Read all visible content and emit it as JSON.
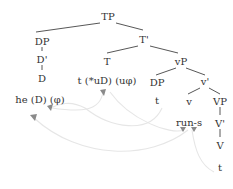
{
  "diagram": {
    "type": "syntax-tree",
    "colors": {
      "text": "#333333",
      "edges": "#444444",
      "movement_arrows": "#e6e6e6",
      "arrow_heads": "#8a8a8a"
    },
    "nodes": {
      "tp": "TP",
      "dp_subj": "DP",
      "d_bar": "D'",
      "d": "D",
      "he": "he (D) (φ)",
      "t_bar": "T'",
      "t": "T",
      "t_features": "t (*uD) (uφ)",
      "vp_small": "vP",
      "dp_trace_label": "DP",
      "dp_trace": "t",
      "v_bar_small": "v'",
      "v_small": "v",
      "runs": "run-s",
      "vp": "VP",
      "v_bar": "V'",
      "v": "V",
      "v_trace": "t"
    },
    "movement_arrows": [
      {
        "from": "dp_trace",
        "to": "he",
        "label": "subject raising"
      },
      {
        "from": "t_features",
        "to": "he",
        "label": "agreement"
      },
      {
        "from": "v_trace",
        "to": "runs",
        "label": "V-to-v movement"
      },
      {
        "from": "runs",
        "to": "t_features",
        "label": "affix lowering"
      }
    ]
  }
}
